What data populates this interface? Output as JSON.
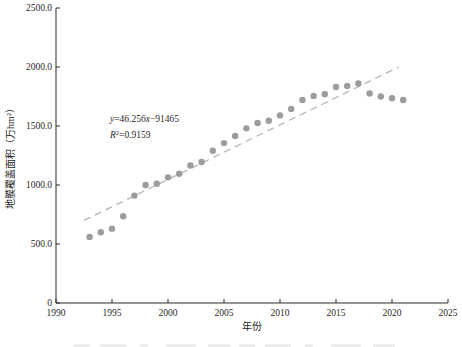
{
  "figure": {
    "background": "#ffffff",
    "annotation": {
      "eq_var1": "y",
      "eq_mid": "=46.256",
      "eq_var2": "x",
      "eq_tail": "−91465",
      "r_base": "R",
      "r_exp": "2",
      "r_tail": "=0.9159"
    }
  },
  "chart_data": {
    "type": "scatter",
    "x": [
      1993,
      1994,
      1995,
      1996,
      1997,
      1998,
      1999,
      2000,
      2001,
      2002,
      2003,
      2004,
      2005,
      2006,
      2007,
      2008,
      2009,
      2010,
      2011,
      2012,
      2013,
      2014,
      2015,
      2016,
      2017,
      2018,
      2019,
      2020,
      2021
    ],
    "values": [
      560,
      600,
      630,
      735,
      910,
      1000,
      1010,
      1065,
      1095,
      1165,
      1195,
      1290,
      1355,
      1415,
      1480,
      1525,
      1545,
      1590,
      1645,
      1720,
      1755,
      1770,
      1830,
      1840,
      1860,
      1775,
      1750,
      1735,
      1720
    ],
    "series_name": "地膜覆盖面积",
    "title": "",
    "xlabel": "年份",
    "ylabel": "地膜覆盖面积（万hm²）",
    "xlim": [
      1990,
      2025
    ],
    "ylim": [
      0,
      2500
    ],
    "x_ticks": [
      1990,
      1995,
      2000,
      2005,
      2010,
      2015,
      2020,
      2025
    ],
    "x_tick_labels": [
      "1990",
      "1995",
      "2000",
      "2005",
      "2010",
      "2015",
      "2020",
      "2025"
    ],
    "y_ticks": [
      0,
      500,
      1000,
      1500,
      2000,
      2500
    ],
    "y_tick_labels": [
      "0",
      "500.0",
      "1000.0",
      "1500.0",
      "2000.0",
      "2500.0"
    ],
    "grid": false,
    "legend": "none",
    "trendline": {
      "style": "dashed",
      "slope": 46.256,
      "intercept": -91465,
      "x_start": 1992.5,
      "x_end": 2020.6,
      "equation": "y=46.256x−91465",
      "r_squared": "R²=0.9159"
    },
    "point_color": "#9c9c9c",
    "trend_color": "#b5b5b5",
    "axis_color": "#2b2b2b"
  }
}
